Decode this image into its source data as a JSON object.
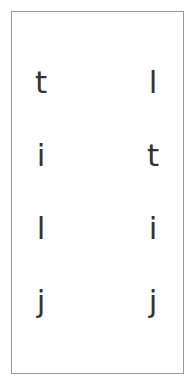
{
  "canvas": {
    "width": 195,
    "height": 386,
    "background_color": "#ffffff"
  },
  "frame": {
    "border_color": "#9a9a9a",
    "border_width": 1.5,
    "fill_color": "#ffffff"
  },
  "letter_grid": {
    "text_color": "#333333",
    "font_size": 31,
    "rows": 4,
    "columns": 2,
    "column_labels": [
      "left",
      "right"
    ],
    "cells": [
      {
        "row": 1,
        "left": "t",
        "right": "l"
      },
      {
        "row": 2,
        "left": "i",
        "right": "t"
      },
      {
        "row": 3,
        "left": "l",
        "right": "i"
      },
      {
        "row": 4,
        "left": "j",
        "right": "j"
      }
    ],
    "left_column_sequence": "t i l j",
    "right_column_sequence": "l t i j"
  }
}
